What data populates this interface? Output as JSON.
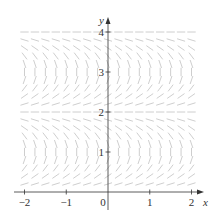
{
  "chart_data": {
    "type": "slope_field",
    "title": "",
    "equation_model": "dy/dx = tan(pi*y/2)",
    "xlabel": "x",
    "ylabel": "y",
    "xlim": [
      -2,
      2
    ],
    "ylim": [
      0,
      4
    ],
    "x_ticks": [
      -2,
      -1,
      0,
      1,
      2
    ],
    "x_tick_labels": [
      "−2",
      "−1",
      "0",
      "1",
      "2"
    ],
    "y_ticks": [
      1,
      2,
      3,
      4
    ],
    "y_tick_labels": [
      "1",
      "2",
      "3",
      "4"
    ],
    "grid": false,
    "equilibrium_lines_y": [
      0,
      2,
      4
    ],
    "vertical_slope_y": [
      1,
      3
    ],
    "sample_spacing": {
      "x": 0.25,
      "y": 0.2
    },
    "segment_color": "#c8c8c8",
    "axis_color": "#333333"
  },
  "axes": {
    "origin_label": "0",
    "x_label": "x",
    "y_label": "y"
  }
}
